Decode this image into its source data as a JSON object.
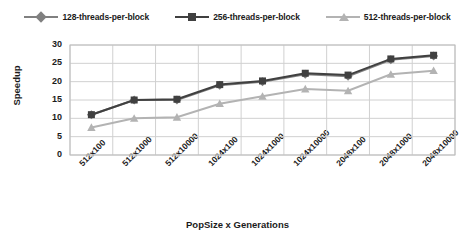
{
  "chart_data": {
    "type": "line",
    "title": "",
    "xlabel": "PopSize x Generations",
    "ylabel": "Speedup",
    "categories": [
      "512x100",
      "512x1000",
      "512x10000",
      "1024x100",
      "1024x1000",
      "1024x10000",
      "2048x100",
      "2048x1000",
      "2048x10000"
    ],
    "yticks": [
      0,
      5,
      10,
      15,
      20,
      25,
      30
    ],
    "ylim": [
      0,
      30
    ],
    "grid": true,
    "legend_position": "top",
    "series": [
      {
        "name": "128-threads-per-block",
        "marker": "diamond",
        "color": "#808080",
        "values": [
          11,
          15,
          15,
          19,
          20,
          22,
          21.5,
          26,
          27
        ]
      },
      {
        "name": "256-threads-per-block",
        "marker": "square",
        "color": "#404040",
        "values": [
          11,
          15,
          15.2,
          19.2,
          20.2,
          22.3,
          21.8,
          26.2,
          27.2
        ]
      },
      {
        "name": "512-threads-per-block",
        "marker": "triangle",
        "color": "#b3b3b3",
        "values": [
          7.5,
          10,
          10.3,
          14,
          16,
          18,
          17.5,
          22,
          23
        ]
      }
    ]
  }
}
